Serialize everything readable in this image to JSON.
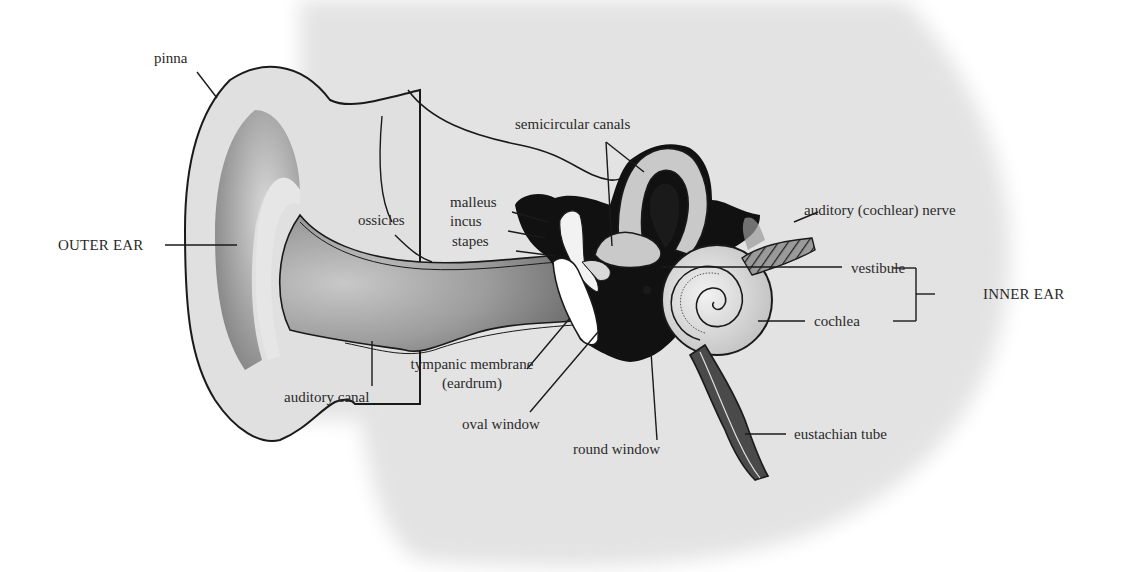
{
  "diagram": {
    "regions": {
      "outer_ear": "OUTER EAR",
      "inner_ear": "INNER EAR"
    },
    "labels": {
      "pinna": "pinna",
      "ossicles": "ossicles",
      "malleus": "malleus",
      "incus": "incus",
      "stapes": "stapes",
      "semicircular_canals": "semicircular canals",
      "auditory_nerve": "auditory (cochlear) nerve",
      "vestibule": "vestibule",
      "cochlea": "cochlea",
      "tympanic_membrane": "tympanic membrane",
      "eardrum": "(eardrum)",
      "auditory_canal": "auditory canal",
      "oval_window": "oval window",
      "round_window": "round window",
      "eustachian_tube": "eustachian tube"
    },
    "colors": {
      "background_blob": "#e3e3e3",
      "ear_fill": "#e0e0e0",
      "canal_fill": "#9a9a9a",
      "dark_fill": "#111111",
      "line": "#1a1a1a",
      "text": "#2a2a2a"
    }
  }
}
